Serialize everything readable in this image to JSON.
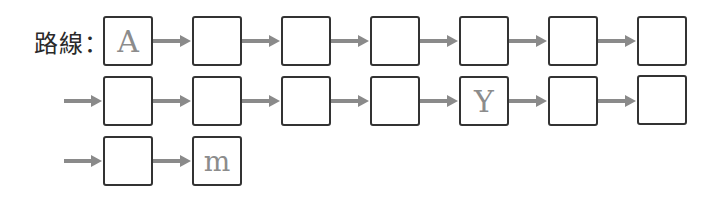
{
  "label": "路線：",
  "colors": {
    "box_border": "#333333",
    "arrow": "#8a8a8a",
    "letter": "#8c8c8c"
  },
  "rows": [
    {
      "lead_arrow": false,
      "boxes": [
        "A",
        "",
        "",
        "",
        "",
        "",
        ""
      ]
    },
    {
      "lead_arrow": true,
      "boxes": [
        "",
        "",
        "",
        "",
        "Y",
        "",
        ""
      ]
    },
    {
      "lead_arrow": true,
      "boxes": [
        "",
        "m"
      ]
    }
  ],
  "r0": {
    "b0": "A",
    "b1": "",
    "b2": "",
    "b3": "",
    "b4": "",
    "b5": "",
    "b6": ""
  },
  "r1": {
    "b0": "",
    "b1": "",
    "b2": "",
    "b3": "",
    "b4": "Y",
    "b5": "",
    "b6": ""
  },
  "r2": {
    "b0": "",
    "b1": "m"
  }
}
